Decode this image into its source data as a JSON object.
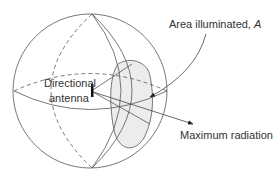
{
  "diagram": {
    "labels": {
      "antenna_line1": "Directional",
      "antenna_line2": "antenna",
      "area_text": "Area illuminated, ",
      "area_symbol": "A",
      "max_radiation": "Maximum radiation"
    },
    "colors": {
      "line": "#555555",
      "shade": "#ececec",
      "text": "#333333"
    }
  }
}
